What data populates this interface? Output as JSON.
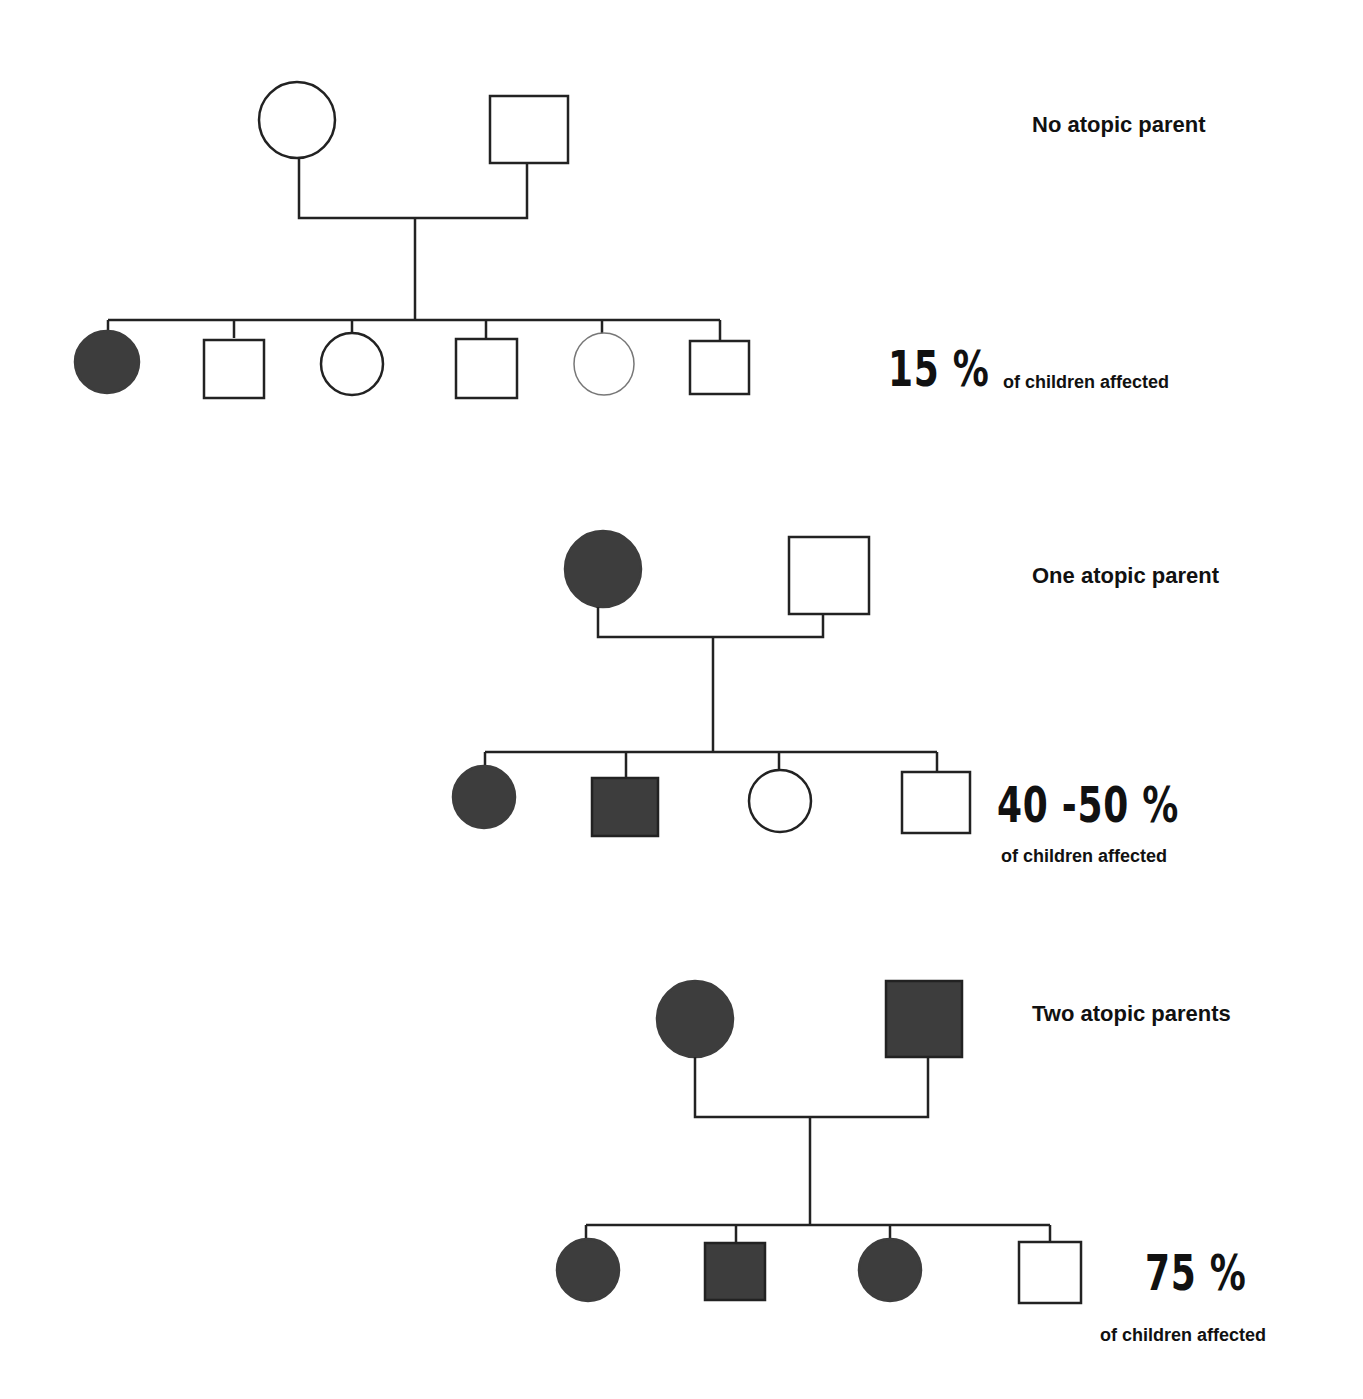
{
  "colors": {
    "affected": "#3d3d3d",
    "line": "#222222",
    "background": "#ffffff"
  },
  "panels": [
    {
      "title": "No atopic parent",
      "percent": "15 %",
      "caption": "of children affected",
      "parents": [
        {
          "shape": "circle",
          "affected": false,
          "x": 297,
          "y": 120,
          "r": 38
        },
        {
          "shape": "square",
          "affected": false,
          "x": 529,
          "y": 130,
          "s": 72
        }
      ],
      "children": [
        {
          "shape": "circle",
          "affected": true
        },
        {
          "shape": "square",
          "affected": false
        },
        {
          "shape": "circle",
          "affected": false
        },
        {
          "shape": "square",
          "affected": false
        },
        {
          "shape": "circle",
          "affected": false
        },
        {
          "shape": "square",
          "affected": false
        }
      ]
    },
    {
      "title": "One atopic parent",
      "percent": "40 -50 %",
      "caption": "of children affected",
      "parents": [
        {
          "shape": "circle",
          "affected": true
        },
        {
          "shape": "square",
          "affected": false
        }
      ],
      "children": [
        {
          "shape": "circle",
          "affected": true
        },
        {
          "shape": "square",
          "affected": true
        },
        {
          "shape": "circle",
          "affected": false
        },
        {
          "shape": "square",
          "affected": false
        }
      ]
    },
    {
      "title": "Two atopic parents",
      "percent": "75 %",
      "caption": "of children affected",
      "parents": [
        {
          "shape": "circle",
          "affected": true
        },
        {
          "shape": "square",
          "affected": true
        }
      ],
      "children": [
        {
          "shape": "circle",
          "affected": true
        },
        {
          "shape": "square",
          "affected": true
        },
        {
          "shape": "circle",
          "affected": true
        },
        {
          "shape": "square",
          "affected": false
        }
      ]
    }
  ]
}
